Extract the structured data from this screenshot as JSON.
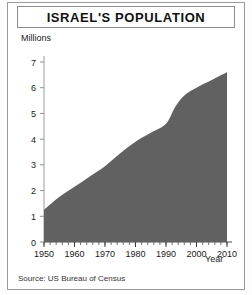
{
  "figure": {
    "title": "ISRAEL'S POPULATION",
    "source_note": "Source: US Bureau of Census"
  },
  "chart_data": {
    "type": "area",
    "title": "ISRAEL'S POPULATION",
    "xlabel": "Year",
    "ylabel": "Millions",
    "xlim": [
      1950,
      2010
    ],
    "ylim": [
      0,
      7
    ],
    "grid": false,
    "legend": false,
    "fill_color": "#616161",
    "xticks": [
      1950,
      1960,
      1970,
      1980,
      1990,
      2000,
      2010
    ],
    "xtick_labels": [
      "1950",
      "1960",
      "1970",
      "1980",
      "1990",
      "2000",
      "2010"
    ],
    "x_minor_tick_step": 2,
    "yticks": [
      0,
      1,
      2,
      3,
      4,
      5,
      6,
      7
    ],
    "ytick_labels": [
      "0",
      "1",
      "2",
      "3",
      "4",
      "5",
      "6",
      "7"
    ],
    "x": [
      1950,
      1955,
      1960,
      1965,
      1970,
      1975,
      1980,
      1985,
      1990,
      1993,
      1996,
      2000,
      2005,
      2010
    ],
    "values": [
      1.25,
      1.75,
      2.15,
      2.55,
      2.95,
      3.45,
      3.9,
      4.25,
      4.6,
      5.25,
      5.7,
      6.0,
      6.3,
      6.6
    ],
    "series": [
      {
        "name": "Israel population (millions)",
        "values": [
          1.25,
          1.75,
          2.15,
          2.55,
          2.95,
          3.45,
          3.9,
          4.25,
          4.6,
          5.25,
          5.7,
          6.0,
          6.3,
          6.6
        ]
      }
    ],
    "annotations": [],
    "source": "Source: US Bureau of Census"
  }
}
